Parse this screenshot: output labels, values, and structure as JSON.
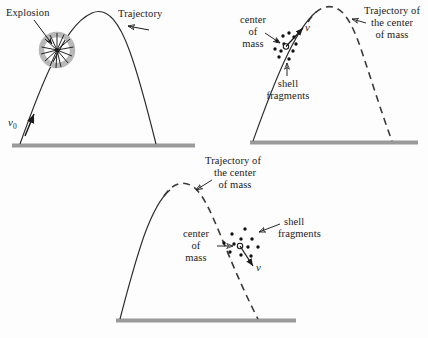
{
  "figure": {
    "title": "",
    "background": "#fdfdfd",
    "ink": "#1b1b1b",
    "ground_color": "#9a9a9a",
    "explosion_ring_color": "#b8b8b8"
  },
  "panels": [
    {
      "id": "panel-top-left",
      "labels": {
        "explosion": "Explosion",
        "trajectory": "Trajectory",
        "initial_velocity": "v",
        "initial_velocity_subscript": "0"
      },
      "elements": {
        "ground": "ground-line",
        "curve": "solid-parabolic-trajectory",
        "burst": "explosion-starburst",
        "ring": "explosion-ring"
      }
    },
    {
      "id": "panel-top-right",
      "labels": {
        "center_of_mass": [
          "center",
          "of",
          "mass"
        ],
        "shell_fragments": [
          "shell",
          "fragments"
        ],
        "trajectory_com": [
          "Trajectory of",
          "the center",
          "of mass"
        ],
        "velocity": "v"
      },
      "elements": {
        "ground": "ground-line",
        "ascending_curve": "solid-ascending-trajectory",
        "descending_curve": "dashed-center-of-mass-trajectory",
        "com_marker": "open-circle",
        "fragment_count": 11
      }
    },
    {
      "id": "panel-bottom",
      "labels": {
        "center_of_mass": [
          "center",
          "of",
          "mass"
        ],
        "shell_fragments": [
          "shell",
          "fragments"
        ],
        "trajectory_com": [
          "Trajectory of",
          "the center",
          "of mass"
        ],
        "velocity": "v"
      },
      "elements": {
        "ground": "ground-line",
        "ascending_curve": "solid-ascending-trajectory",
        "descending_curve": "dashed-center-of-mass-trajectory",
        "com_marker": "open-circle",
        "fragment_count": 11
      }
    }
  ]
}
